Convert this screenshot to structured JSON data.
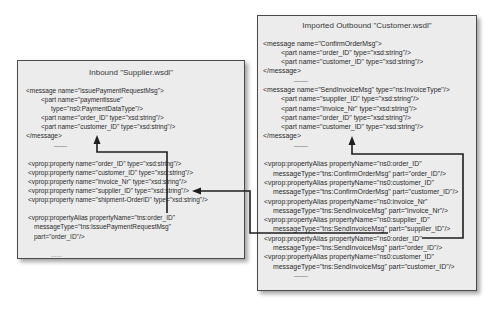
{
  "inbound": {
    "title": "Inbound \"Supplier.wsdl\"",
    "lines": [
      "<message name=\"issuePaymentRequestMsg\">",
      "<part name=\"paymentissue\"",
      "type=\"ns0:PaymentDataType\"/>",
      "<part name=\"order_ID\" type=\"xsd:string\"/>",
      "<part name=\"customer_ID\" type=\"xsd:string\"/>",
      "</message>",
      "——",
      "",
      "<vprop:property name=\"order_ID\" type=\"xsd:string\"/>",
      "<vprop:property name=\"customer_ID\" type=\"xsd:string\"/>",
      "<vprop:property name=\"invoice_Nr\" type=\"xsd:string\"/>",
      "<vprop:property name=\"supplier_ID\" type=\"xsd:string\"/>",
      "<vprop:property name=\"shipment-OrderID\" type=\"xsd:string\"/>",
      "",
      "<vprop:propertyAlias propertyName=\"tns:order_ID\"",
      "messageType=\"tns:IssuePaymentRequestMsg\"",
      "part=\"order_ID\"/>",
      "",
      "......"
    ]
  },
  "outbound": {
    "title": "Imported Outbound \"Customer.wsdl\"",
    "lines": [
      "<message name=\"ConfirmOrderMsg\">",
      "<part name=\"order_ID\" type=\"xsd:string\"/>",
      "<part name=\"customer_ID\" type=\"xsd:string\"/>",
      "</message>",
      "——",
      "<message name=\"SendInvoiceMsg\" type=\"ns:InvoiceType\"/>",
      "<part name=\"supplier_ID\" type=\"xsd:string\"/>",
      "<part name=\"invoice_Nr\" type=\"xsd:string\"/>",
      "<part name=\"order_ID\" type=\"xsd:string\"/>",
      "<part name=\"customer_ID\" type=\"xsd:string\"/>",
      "</message>",
      "——",
      "",
      "<vprop:propertyAlias propertyName=\"ns0:order_ID\"",
      "messageType=\"tns:ConfirmOrderMsg\" part=\"order_ID\"/>",
      "<vprop:propertyAlias propertyName=\"ns0:customer_ID\"",
      "messageType=\"tns:ConfirmOrderMsg\" part=\"customer_ID\"/>",
      "<vprop:propertyAlias propertyName=\"ns0:invoice_Nr\"",
      "messageType=\"tns:SendInvoiceMsg\" part=\"invoice_Nr\"/>",
      "<vprop:propertyAlias propertyName=\"ns0:supplier_ID\"",
      "messageType=\"tns:SendInvoiceMsg\" part=\"supplier_ID\"/>",
      "<vprop:propertyAlias propertyName=\"ns0:order_ID\"",
      "messageType=\"tns:SendInvoiceMsg\" part=\"order_ID\"/>",
      "<vprop:propertyAlias propertyName=\"ns0:customer_ID\"",
      "messageType=\"tns:SendInvoiceMsg\" part=\"customer_ID\"/>",
      "——"
    ]
  }
}
